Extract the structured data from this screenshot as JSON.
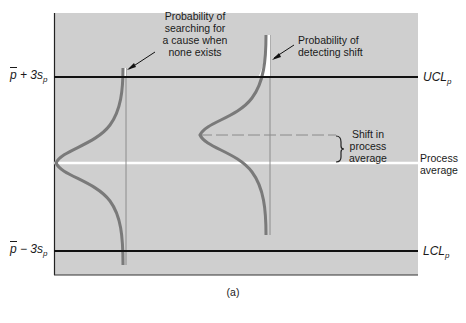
{
  "figure": {
    "caption": "(a)",
    "colors": {
      "plot_background": "#cfcfcf",
      "control_lines": "#111111",
      "process_average_line": "#ffffff",
      "curves": "#7a7a7a",
      "vertical_markers": "#8c8c8c"
    }
  },
  "y_labels": {
    "upper": {
      "prefix": "p",
      "suffix": " + 3s",
      "sub": "p"
    },
    "lower": {
      "prefix": "p",
      "suffix": " − 3s",
      "sub": "p"
    }
  },
  "right_labels": {
    "ucl": {
      "main": "UCL",
      "sub": "p"
    },
    "process_average": "Process average",
    "lcl": {
      "main": "LCL",
      "sub": "p"
    }
  },
  "annotations": {
    "type1_error": "Probability of searching for a cause when none exists",
    "type1_lines": [
      "Probability of",
      "searching for",
      "a cause when",
      "none exists"
    ],
    "type2": "Probability of detecting shift",
    "type2_lines": [
      "Probability of",
      "detecting shift"
    ],
    "shift": "Shift in process average",
    "shift_lines": [
      "Shift in",
      "process",
      "average"
    ]
  }
}
